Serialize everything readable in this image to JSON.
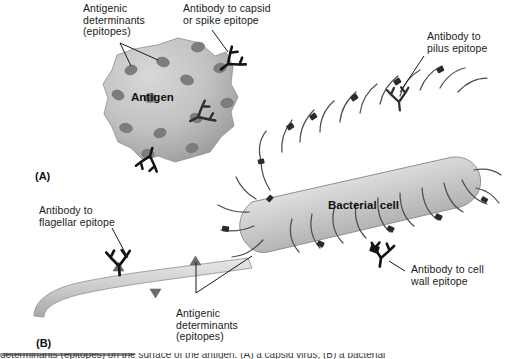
{
  "figure": {
    "background_color": "#ffffff",
    "ink_color": "#1a1a1a"
  },
  "panels": [
    {
      "tag": "(A)",
      "name": "panel-a-antigen",
      "x": 35,
      "y": 170
    },
    {
      "tag": "(B)",
      "name": "panel-b-bacterial-cell",
      "x": 36,
      "y": 337
    }
  ],
  "labels": {
    "antigenic_determinants_top": "Antigenic\ndeterminants\n(epitopes)",
    "antibody_capsid": "Antibody to capsid\nor spike epitope",
    "antibody_pilus": "Antibody to\npilus epitope",
    "antibody_flagellar": "Antibody to\nflagellar epitope",
    "antibody_cell_wall": "Antibody to cell\nwall epitope",
    "antigenic_determinants_bottom": "Antigenic\ndeterminants\n(epitopes)"
  },
  "inline_labels": {
    "antigen": "Antigen",
    "bacterial_cell": "Bacterial cell"
  },
  "caption": {
    "text": "determinants (epitopes) on the surface of the antigen. (A) a capsid virus; (B) a bacterial"
  },
  "colors": {
    "antigen_fill_light": "#c9c9c9",
    "antigen_fill_dark": "#9a9a9a",
    "epitope_fill": "#7a7a7a",
    "cell_fill_light": "#f2f2f2",
    "cell_fill_dark": "#9d9d9d",
    "pilus_stroke": "#4a4a4a",
    "antibody_dark": "#111111",
    "antibody_mid": "#3a3a3a",
    "flagellum_fill": "#cfcfcf",
    "leader_line": "#1a1a1a"
  },
  "structures": {
    "antigen": {
      "name": "antigen-blob",
      "epitope_count": 13,
      "bound_antibodies": 3
    },
    "bacterial_cell": {
      "name": "bacterial-rod",
      "pilus_count": 26,
      "pilus_epitopes": 12,
      "bound_antibodies": 2
    },
    "flagellum": {
      "name": "flagellum",
      "triangle_epitopes": 3,
      "bound_antibodies": 1
    }
  }
}
